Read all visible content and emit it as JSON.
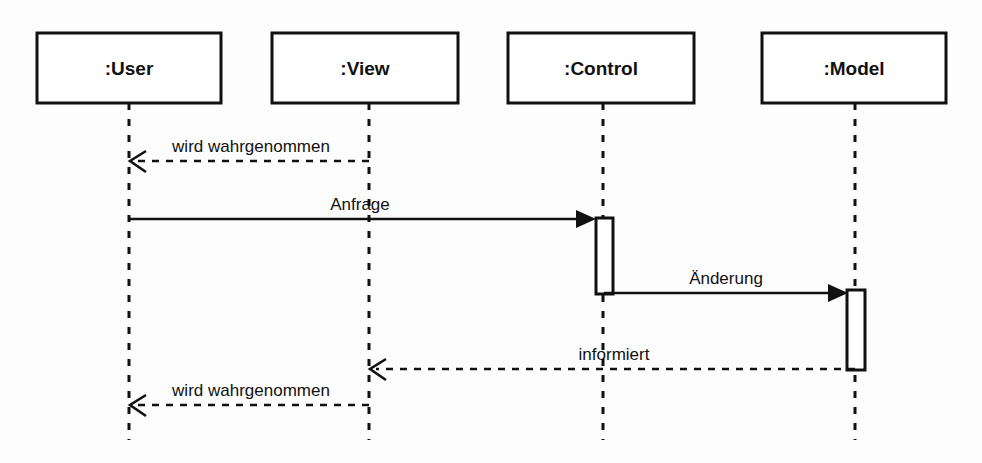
{
  "diagram": {
    "canvas": {
      "width": 982,
      "height": 463,
      "background": "#fdfdfd"
    },
    "line_color": "#111111",
    "participants": [
      {
        "id": "user",
        "label": ":User",
        "box_x": 37,
        "box_y": 33,
        "box_w": 184,
        "box_h": 70,
        "lifeline_x": 129,
        "lifeline_bottom": 440
      },
      {
        "id": "view",
        "label": ":View",
        "box_x": 272,
        "box_y": 33,
        "box_w": 186,
        "box_h": 70,
        "lifeline_x": 369,
        "lifeline_bottom": 440
      },
      {
        "id": "control",
        "label": ":Control",
        "box_x": 508,
        "box_y": 33,
        "box_w": 186,
        "box_h": 70,
        "lifeline_x": 603,
        "lifeline_bottom": 440
      },
      {
        "id": "model",
        "label": ":Model",
        "box_x": 762,
        "box_y": 33,
        "box_w": 184,
        "box_h": 70,
        "lifeline_x": 855,
        "lifeline_bottom": 440
      }
    ],
    "activations": [
      {
        "id": "control-activation",
        "owner": "control",
        "x": 596,
        "y": 218,
        "w": 17,
        "h": 76
      },
      {
        "id": "model-activation",
        "owner": "model",
        "x": 847,
        "y": 290,
        "w": 18,
        "h": 80
      }
    ],
    "messages": [
      {
        "id": "msg-wird-wahrgenommen-1",
        "label": "wird wahrgenommen",
        "from": "view",
        "to": "user",
        "x1": 369,
        "x2": 133,
        "y": 161,
        "style": "dashed",
        "arrowhead": "open",
        "label_x": 251,
        "label_y": 152
      },
      {
        "id": "msg-anfrage",
        "label": "Anfrage",
        "from": "user",
        "to": "control",
        "x1": 129,
        "x2": 596,
        "y": 219,
        "style": "solid",
        "arrowhead": "filled",
        "label_x": 360,
        "label_y": 210
      },
      {
        "id": "msg-aenderung",
        "label": "Änderung",
        "from": "control",
        "to": "model",
        "x1": 604,
        "x2": 847,
        "y": 293,
        "style": "solid",
        "arrowhead": "filled",
        "label_x": 726,
        "label_y": 284
      },
      {
        "id": "msg-informiert",
        "label": "informiert",
        "from": "model",
        "to": "view",
        "x1": 855,
        "x2": 373,
        "y": 369,
        "style": "dashed",
        "arrowhead": "open",
        "label_x": 614,
        "label_y": 360
      },
      {
        "id": "msg-wird-wahrgenommen-2",
        "label": "wird wahrgenommen",
        "from": "view",
        "to": "user",
        "x1": 369,
        "x2": 133,
        "y": 405,
        "style": "dashed",
        "arrowhead": "open",
        "label_x": 251,
        "label_y": 396
      }
    ]
  }
}
